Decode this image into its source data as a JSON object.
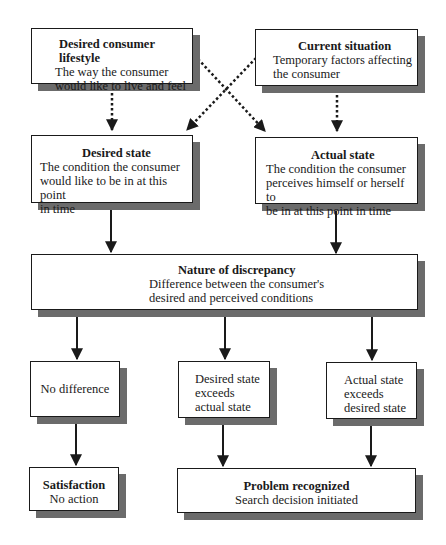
{
  "diagram": {
    "boxes": {
      "lifestyle": {
        "title": "Desired consumer lifestyle",
        "line1": "The way the consumer",
        "line2": "would like to live and feel"
      },
      "situation": {
        "title": "Current situation",
        "line1": "Temporary factors affecting",
        "line2": "the consumer"
      },
      "desired_state": {
        "title": "Desired state",
        "line1": "The condition the consumer",
        "line2": "would like to be in at this point",
        "line3": "in time"
      },
      "actual_state": {
        "title": "Actual state",
        "line1": "The condition the consumer",
        "line2": "perceives himself or herself to",
        "line3": "be in at this point in time"
      },
      "discrepancy": {
        "title": "Nature of discrepancy",
        "line1": "Difference between the consumer's",
        "line2": "desired and perceived conditions"
      },
      "no_difference": {
        "line1": "No difference"
      },
      "desired_exceeds": {
        "line1": "Desired state",
        "line2": "exceeds",
        "line3": "actual state"
      },
      "actual_exceeds": {
        "line1": "Actual state",
        "line2": "exceeds",
        "line3": "desired state"
      },
      "satisfaction": {
        "title": "Satisfaction",
        "line1": "No action"
      },
      "problem": {
        "title": "Problem recognized",
        "line1": "Search decision initiated"
      }
    },
    "edges": [
      {
        "from": "lifestyle",
        "to": "desired_state",
        "style": "dotted"
      },
      {
        "from": "lifestyle",
        "to": "actual_state",
        "style": "dotted"
      },
      {
        "from": "situation",
        "to": "desired_state",
        "style": "dotted"
      },
      {
        "from": "situation",
        "to": "actual_state",
        "style": "dotted"
      },
      {
        "from": "desired_state",
        "to": "discrepancy",
        "style": "solid"
      },
      {
        "from": "actual_state",
        "to": "discrepancy",
        "style": "solid"
      },
      {
        "from": "discrepancy",
        "to": "no_difference",
        "style": "solid"
      },
      {
        "from": "discrepancy",
        "to": "desired_exceeds",
        "style": "solid"
      },
      {
        "from": "discrepancy",
        "to": "actual_exceeds",
        "style": "solid"
      },
      {
        "from": "no_difference",
        "to": "satisfaction",
        "style": "solid"
      },
      {
        "from": "desired_exceeds",
        "to": "problem",
        "style": "solid"
      },
      {
        "from": "actual_exceeds",
        "to": "problem",
        "style": "solid"
      }
    ],
    "colors": {
      "border": "#1a1a1a",
      "shadow": "#6b6b6b",
      "background": "#ffffff"
    }
  }
}
